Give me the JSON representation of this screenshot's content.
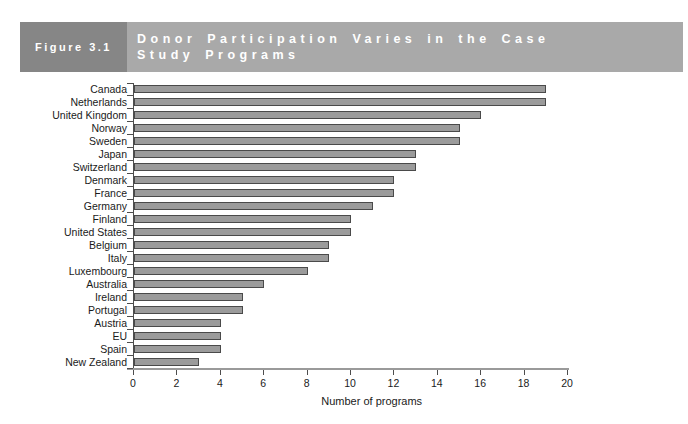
{
  "header": {
    "figure_label": "Figure 3.1",
    "title_line1": "Donor Participation Varies in the Case",
    "title_line2": "Study Programs"
  },
  "chart_data": {
    "type": "bar",
    "orientation": "horizontal",
    "title": "Donor Participation Varies in the Case Study Programs",
    "categories": [
      "Canada",
      "Netherlands",
      "United Kingdom",
      "Norway",
      "Sweden",
      "Japan",
      "Switzerland",
      "Denmark",
      "France",
      "Germany",
      "Finland",
      "United States",
      "Belgium",
      "Italy",
      "Luxembourg",
      "Australia",
      "Ireland",
      "Portugal",
      "Austria",
      "EU",
      "Spain",
      "New Zealand"
    ],
    "values": [
      19,
      19,
      16,
      15,
      15,
      13,
      13,
      12,
      12,
      11,
      10,
      10,
      9,
      9,
      8,
      6,
      5,
      5,
      4,
      4,
      4,
      3
    ],
    "xlabel": "Number of programs",
    "xlim": [
      0,
      20
    ],
    "xticks": [
      0,
      2,
      4,
      6,
      8,
      10,
      12,
      14,
      16,
      18,
      20
    ],
    "grid": false,
    "legend": false
  },
  "colors": {
    "background": "#ffffff",
    "figure_box_bg": "#868686",
    "title_bar_bg": "#a9a9a9",
    "header_text": "#ffffff",
    "bar_color": "#9b9b9b",
    "bar_border_color": "#4a4a4a",
    "axis_line": "#4d4d4d",
    "x_axis_line": "#9a9a9a",
    "tick_text": "#1a1a1a"
  }
}
